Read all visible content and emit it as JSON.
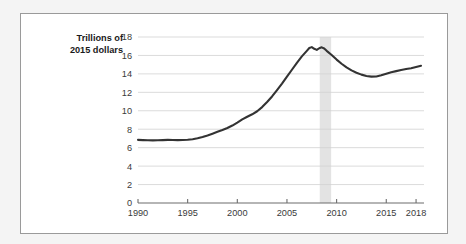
{
  "figure": {
    "background_color": "#f4f4f4",
    "card_color": "#ffffff",
    "card_border_color": "#9a9a9a"
  },
  "chart_data": {
    "type": "line",
    "title": "",
    "subtitle": "",
    "xlabel": "",
    "ylabel": "Trillions of\n2015 dollars",
    "ylabel_line1": "Trillions of",
    "ylabel_line2": "2015 dollars",
    "xlim": [
      1990,
      2018.8
    ],
    "ylim": [
      0,
      18
    ],
    "y_ticks": [
      0,
      2,
      4,
      6,
      8,
      10,
      12,
      14,
      16,
      18
    ],
    "y_tick_labels": [
      "0",
      "2",
      "4",
      "6",
      "8",
      "10",
      "12",
      "14",
      "16",
      "18"
    ],
    "x_ticks": [
      1990,
      1995,
      2000,
      2005,
      2010,
      2015,
      2018
    ],
    "x_tick_labels": [
      "1990",
      "1995",
      "2000",
      "2005",
      "2010",
      "2015",
      "2018"
    ],
    "grid": "horizontal",
    "legend": "none",
    "line_color": "#333333",
    "series": [
      {
        "name": "Trillions of 2015 dollars",
        "x": [
          1990,
          1990.5,
          1991,
          1991.5,
          1992,
          1992.5,
          1993,
          1993.5,
          1994,
          1994.5,
          1995,
          1995.5,
          1996,
          1996.5,
          1997,
          1997.5,
          1998,
          1998.5,
          1999,
          1999.5,
          2000,
          2000.5,
          2001,
          2001.5,
          2002,
          2002.5,
          2003,
          2003.5,
          2004,
          2004.5,
          2005,
          2005.5,
          2006,
          2006.5,
          2007,
          2007.25,
          2007.5,
          2007.75,
          2008,
          2008.25,
          2008.5,
          2008.75,
          2009,
          2009.5,
          2010,
          2010.5,
          2011,
          2011.5,
          2012,
          2012.5,
          2013,
          2013.5,
          2014,
          2014.5,
          2015,
          2015.5,
          2016,
          2016.5,
          2017,
          2017.5,
          2018,
          2018.5
        ],
        "values": [
          6.85,
          6.82,
          6.8,
          6.79,
          6.8,
          6.82,
          6.84,
          6.83,
          6.82,
          6.83,
          6.86,
          6.92,
          7.02,
          7.16,
          7.33,
          7.52,
          7.72,
          7.92,
          8.14,
          8.4,
          8.72,
          9.06,
          9.35,
          9.62,
          9.95,
          10.4,
          10.95,
          11.55,
          12.25,
          12.95,
          13.7,
          14.45,
          15.2,
          15.9,
          16.5,
          16.8,
          16.9,
          16.72,
          16.6,
          16.78,
          16.88,
          16.75,
          16.5,
          16.05,
          15.55,
          15.1,
          14.7,
          14.38,
          14.12,
          13.92,
          13.78,
          13.7,
          13.72,
          13.85,
          14.02,
          14.18,
          14.3,
          14.42,
          14.52,
          14.62,
          14.75,
          14.88
        ]
      }
    ],
    "recession_bands": [
      {
        "start": 2008.3,
        "end": 2009.45,
        "color": "#e3e3e3"
      }
    ]
  }
}
